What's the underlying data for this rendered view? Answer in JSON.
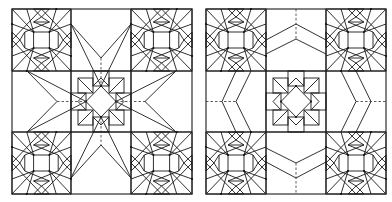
{
  "figure": {
    "panels": [
      {
        "id": "left",
        "variant": "star-points",
        "connector_style": "long pointed star rays from center block to corner blocks with dashed center axes"
      },
      {
        "id": "right",
        "variant": "hexagonal-rings",
        "connector_style": "chevron / hexagonal bands around center block with dashed axes"
      }
    ],
    "stroke_color": "#1a1a1a",
    "background_color": "#ffffff"
  }
}
